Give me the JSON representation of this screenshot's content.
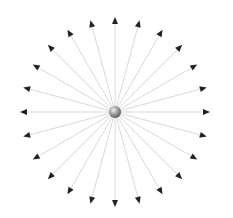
{
  "diagram": {
    "type": "radial-burst",
    "center": {
      "x": 115,
      "y": 112
    },
    "sphere_radius": 6,
    "arrow_count": 24,
    "angle_step_deg": 15,
    "arrow_length": 95,
    "arrowhead_length": 7,
    "arrowhead_width": 6,
    "colors": {
      "background": "#ffffff",
      "line": "#d9d9d9",
      "arrowhead": "#222222",
      "sphere_highlight": "#f2f2f2",
      "sphere_mid": "#a6a6a6",
      "sphere_shadow": "#555555"
    }
  }
}
